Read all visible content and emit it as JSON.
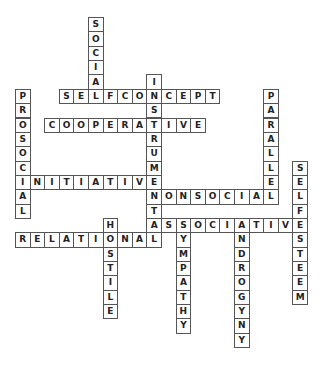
{
  "puzzle": {
    "type": "crossword",
    "cell": {
      "origin_x": 15,
      "origin_y": 17,
      "step_x": 14.6,
      "step_y": 14.35
    },
    "colors": {
      "border": "#555555",
      "text": "#222222",
      "background": "#ffffff"
    },
    "words": [
      {
        "word": "SOCIAL",
        "dir": "down",
        "col": 5,
        "row": 0
      },
      {
        "word": "INSTRUMENTAL",
        "dir": "down",
        "col": 9,
        "row": 4
      },
      {
        "word": "SELFCONCEPT",
        "dir": "across",
        "col": 3,
        "row": 5
      },
      {
        "word": "PROSOCIAL",
        "dir": "down",
        "col": 0,
        "row": 5
      },
      {
        "word": "PARALLEL",
        "dir": "down",
        "col": 17,
        "row": 5
      },
      {
        "word": "COOPERATIVE",
        "dir": "across",
        "col": 2,
        "row": 7
      },
      {
        "word": "SELFESTEEM",
        "dir": "down",
        "col": 19,
        "row": 10
      },
      {
        "word": "INITIATIVE",
        "dir": "across",
        "col": 0,
        "row": 11
      },
      {
        "word": "NONSOCIAL",
        "dir": "across",
        "col": 9,
        "row": 12
      },
      {
        "word": "ASSOCIATIVE",
        "dir": "across",
        "col": 9,
        "row": 14
      },
      {
        "word": "HOSTILE",
        "dir": "down",
        "col": 6,
        "row": 14
      },
      {
        "word": "SYMPATHY",
        "dir": "down",
        "col": 11,
        "row": 14
      },
      {
        "word": "ANDROGYNY",
        "dir": "down",
        "col": 15,
        "row": 14
      },
      {
        "word": "RELATIONAL",
        "dir": "across",
        "col": 0,
        "row": 15
      }
    ]
  }
}
